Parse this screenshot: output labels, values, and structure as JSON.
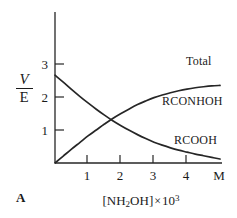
{
  "figure": {
    "panel_letter": "A",
    "background": "#ffffff",
    "ink_color": "#262626"
  },
  "axes": {
    "y_label_numerator": "V",
    "y_label_denominator": "E",
    "y_tick_labels": [
      "1",
      "2",
      "3"
    ],
    "x_tick_labels": [
      "1",
      "2",
      "3",
      "4"
    ],
    "x_end_label": "M",
    "x_caption_prefix": "[NH",
    "x_caption_sub": "2",
    "x_caption_mid": "OH]",
    "x_caption_times": "×",
    "x_caption_base": "10",
    "x_caption_exp": "3"
  },
  "curve_labels": {
    "total": "Total",
    "hydroxamate": "RCONHOH",
    "acid": "RCOOH"
  },
  "chart_data": {
    "type": "line",
    "title": "",
    "xlabel": "[NH2OH] × 10^3",
    "ylabel": "V/E",
    "xlim": [
      0,
      5.05
    ],
    "ylim": [
      0,
      3.45
    ],
    "xticks": [
      1,
      2,
      3,
      4
    ],
    "yticks": [
      1,
      2,
      3
    ],
    "x_axis_end_label": "M",
    "grid": false,
    "legend": "inline-right-labels",
    "x": [
      0,
      0.25,
      0.5,
      0.75,
      1.0,
      1.25,
      1.5,
      1.75,
      2.0,
      2.25,
      2.5,
      2.75,
      3.0,
      3.25,
      3.5,
      3.75,
      4.0,
      4.25,
      4.5,
      4.75,
      5.0
    ],
    "series": [
      {
        "name": "Total",
        "label": "Total",
        "values": [
          2.66,
          2.66,
          2.655,
          2.65,
          2.65,
          2.645,
          2.64,
          2.64,
          2.635,
          2.63,
          2.63,
          2.625,
          2.62,
          2.62,
          2.615,
          2.61,
          2.61,
          2.605,
          2.6,
          2.6,
          2.6
        ]
      },
      {
        "name": "RCONHOH",
        "label": "RCONHOH",
        "values": [
          0.0,
          0.21,
          0.42,
          0.62,
          0.82,
          1.0,
          1.18,
          1.35,
          1.5,
          1.64,
          1.77,
          1.88,
          1.98,
          2.06,
          2.13,
          2.19,
          2.24,
          2.28,
          2.31,
          2.335,
          2.35
        ]
      },
      {
        "name": "RCOOH",
        "label": "RCOOH",
        "values": [
          2.66,
          2.45,
          2.23,
          2.02,
          1.82,
          1.63,
          1.45,
          1.28,
          1.13,
          0.99,
          0.86,
          0.74,
          0.63,
          0.54,
          0.46,
          0.39,
          0.33,
          0.27,
          0.22,
          0.17,
          0.12
        ]
      }
    ],
    "annotations": [
      {
        "text": "Total",
        "x": 4.15,
        "y": 2.95
      },
      {
        "text": "RCONHOH",
        "x": 3.55,
        "y": 1.72
      },
      {
        "text": "RCOOH",
        "x": 3.9,
        "y": 0.72
      }
    ]
  },
  "geometry": {
    "origin_x": 55,
    "origin_y": 163,
    "unit_px_x": 33,
    "unit_px_y": 33,
    "y_axis_top": 12,
    "x_axis_right": 222
  }
}
